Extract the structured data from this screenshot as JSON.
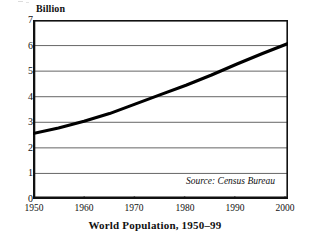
{
  "chart_data": {
    "type": "line",
    "caption": "World Population, 1950–99",
    "xlabel": "",
    "ylabel": "Billion",
    "unit_label": "Billion",
    "source_note": "Source: Census Bureau",
    "grid": true,
    "legend": "none",
    "xlim": [
      1950,
      2000
    ],
    "ylim": [
      0,
      7
    ],
    "xticks": [
      1950,
      1960,
      1970,
      1980,
      1990,
      2000
    ],
    "xtick_labels": [
      "1950",
      "1960",
      "1970",
      "1980",
      "1990",
      "2000"
    ],
    "yticks": [
      0,
      1,
      2,
      3,
      4,
      5,
      6,
      7
    ],
    "ytick_labels": [
      "0",
      "1",
      "2",
      "3",
      "4",
      "5",
      "6",
      "7"
    ],
    "series": [
      {
        "name": "World population",
        "line_color": "#000000",
        "line_width": 3,
        "x": [
          1950,
          1955,
          1960,
          1965,
          1970,
          1975,
          1980,
          1985,
          1990,
          1995,
          2000
        ],
        "values": [
          2.56,
          2.78,
          3.04,
          3.34,
          3.71,
          4.08,
          4.45,
          4.85,
          5.28,
          5.69,
          6.08
        ]
      }
    ],
    "colors": {
      "line": "#000000",
      "grid": "#555555",
      "frame": "#111111",
      "background": "#ffffff",
      "text": "#111111"
    }
  }
}
